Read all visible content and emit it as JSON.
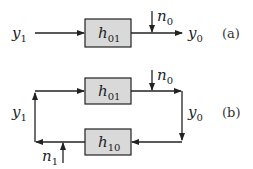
{
  "diagram_a": {
    "tag": "(a)",
    "input": {
      "base": "y",
      "sub": "1"
    },
    "block": {
      "base": "h",
      "sub": "01"
    },
    "noise": {
      "base": "n",
      "sub": "0"
    },
    "output": {
      "base": "y",
      "sub": "0"
    }
  },
  "diagram_b": {
    "tag": "(b)",
    "forward_block": {
      "base": "h",
      "sub": "01"
    },
    "feedback_block": {
      "base": "h",
      "sub": "10"
    },
    "noise_top": {
      "base": "n",
      "sub": "0"
    },
    "noise_bottom": {
      "base": "n",
      "sub": "1"
    },
    "left_signal": {
      "base": "y",
      "sub": "1"
    },
    "right_signal": {
      "base": "y",
      "sub": "0"
    }
  },
  "colors": {
    "block_fill": "#d9d9d9",
    "stroke": "#222222"
  }
}
